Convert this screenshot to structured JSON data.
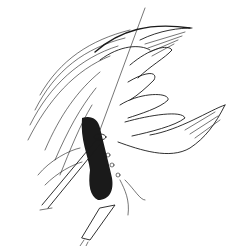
{
  "figure": {
    "kind": "pen-and-ink surgical illustration",
    "colors": {
      "ink": "#1a1a1a",
      "paper": "#ffffff"
    },
    "elements": [
      "hand",
      "tissue-fold",
      "cavity",
      "forceps",
      "sutures",
      "drain-tube",
      "needle-line"
    ]
  }
}
